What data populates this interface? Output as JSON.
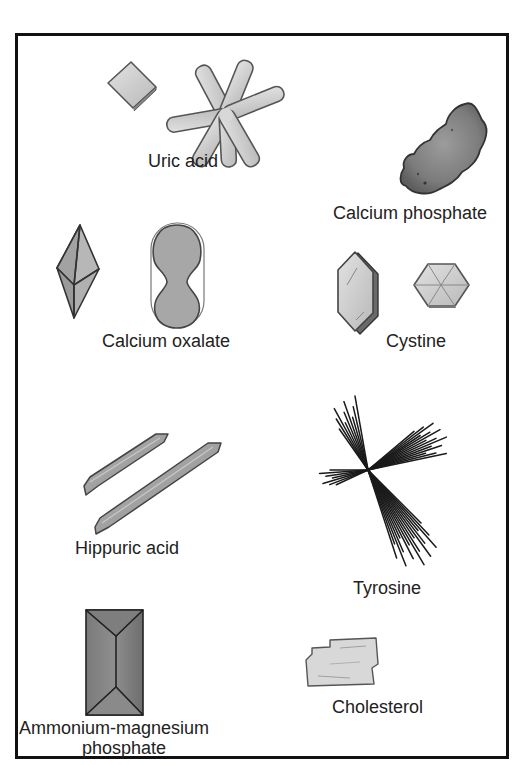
{
  "figure": {
    "crystals": [
      {
        "id": "uric-acid",
        "label": "Uric acid",
        "shapes": [
          "rhombic plate",
          "rosette of rods"
        ]
      },
      {
        "id": "calcium-phosphate",
        "label": "Calcium phosphate",
        "shapes": [
          "amorphous granular mass"
        ]
      },
      {
        "id": "calcium-oxalate",
        "label": "Calcium oxalate",
        "shapes": [
          "envelope / octahedron",
          "dumbbell"
        ]
      },
      {
        "id": "cystine",
        "label": "Cystine",
        "shapes": [
          "elongated hexagonal plate",
          "hexagonal plate"
        ]
      },
      {
        "id": "hippuric-acid",
        "label": "Hippuric acid",
        "shapes": [
          "needle / prism",
          "needle / prism"
        ]
      },
      {
        "id": "tyrosine",
        "label": "Tyrosine",
        "shapes": [
          "sheaves of fine needles"
        ]
      },
      {
        "id": "ammonium-magnesium-phosphate",
        "label_line1": "Ammonium-magnesium",
        "label_line2": "phosphate",
        "shapes": [
          "coffin-lid prism"
        ]
      },
      {
        "id": "cholesterol",
        "label": "Cholesterol",
        "shapes": [
          "notched rectangular plates"
        ]
      }
    ]
  },
  "colors": {
    "frame": "#111111",
    "crystal_light": "#cfcfcf",
    "crystal_mid": "#9a9a9a",
    "crystal_dark": "#6e6e6e",
    "outline": "#444444",
    "text": "#222222"
  }
}
